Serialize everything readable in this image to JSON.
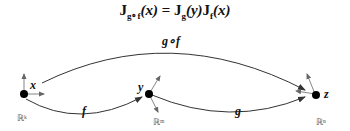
{
  "formula": {
    "lhs_J": "J",
    "lhs_sub": "g∘f",
    "lhs_arg": "(x)",
    "eq": "=",
    "rhs1_J": "J",
    "rhs1_sub": "g",
    "rhs1_arg": "(y)",
    "rhs2_J": "J",
    "rhs2_sub": "f",
    "rhs2_arg": "(x)"
  },
  "points": {
    "x": "x",
    "y": "y",
    "z": "z"
  },
  "maps": {
    "f": "f",
    "g": "g",
    "gf": "g∘f"
  },
  "spaces": {
    "domain": "ℝᵏ",
    "middle": "ℝᵐ",
    "codomain": "ℝⁿ"
  },
  "colors": {
    "line": "#333333",
    "point": "#000000"
  }
}
